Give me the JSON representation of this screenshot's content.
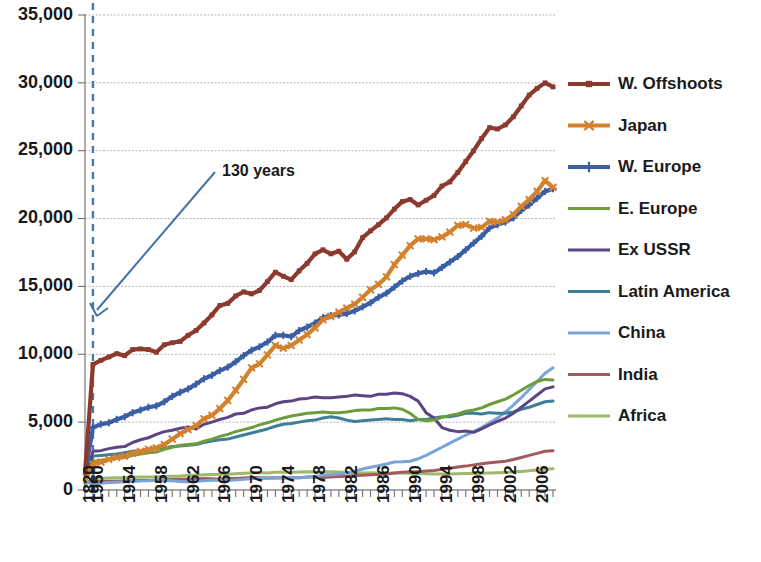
{
  "chart_data": {
    "type": "line",
    "title": "",
    "subtitle": "",
    "xlabel": "",
    "ylabel": "",
    "ylim": [
      0,
      35000
    ],
    "grid": true,
    "legend_position": "right",
    "y_ticks": [
      "0",
      "5,000",
      "10,000",
      "15,000",
      "20,000",
      "25,000",
      "30,000",
      "35,000"
    ],
    "y_tick_values": [
      0,
      5000,
      10000,
      15000,
      20000,
      25000,
      30000,
      35000
    ],
    "x_tick_labels": [
      "1820",
      "1950",
      "1954",
      "1958",
      "1962",
      "1966",
      "1970",
      "1974",
      "1978",
      "1982",
      "1986",
      "1990",
      "1994",
      "1998",
      "2002",
      "2006"
    ],
    "x_tick_values": [
      1820,
      1950,
      1954,
      1958,
      1962,
      1966,
      1970,
      1974,
      1978,
      1982,
      1986,
      1990,
      1994,
      1998,
      2002,
      2006
    ],
    "x_domain_note": "1820 then annual 1950-2008",
    "x": [
      1820,
      1950,
      1951,
      1952,
      1953,
      1954,
      1955,
      1956,
      1957,
      1958,
      1959,
      1960,
      1961,
      1962,
      1963,
      1964,
      1965,
      1966,
      1967,
      1968,
      1969,
      1970,
      1971,
      1972,
      1973,
      1974,
      1975,
      1976,
      1977,
      1978,
      1979,
      1980,
      1981,
      1982,
      1983,
      1984,
      1985,
      1986,
      1987,
      1988,
      1989,
      1990,
      1991,
      1992,
      1993,
      1994,
      1995,
      1996,
      1997,
      1998,
      1999,
      2000,
      2001,
      2002,
      2003,
      2004,
      2005,
      2006,
      2007,
      2008
    ],
    "annotations": [
      {
        "text": "130 years",
        "kind": "arrow-label",
        "points_to_year": 1950,
        "color": "#4472a8"
      }
    ],
    "vertical_marker": {
      "year": 1950,
      "style": "dashed",
      "color": "#4a77b4"
    },
    "series": [
      {
        "name": "W. Offshoots",
        "color": "#8c3a2e",
        "marker": "square",
        "values": [
          1250,
          9250,
          9550,
          9800,
          10050,
          9900,
          10350,
          10400,
          10350,
          10150,
          10700,
          10850,
          10950,
          11400,
          11750,
          12300,
          12900,
          13600,
          13750,
          14300,
          14600,
          14450,
          14700,
          15350,
          16050,
          15750,
          15500,
          16150,
          16700,
          17400,
          17700,
          17400,
          17600,
          17000,
          17550,
          18600,
          19100,
          19550,
          20050,
          20700,
          21250,
          21400,
          21000,
          21350,
          21700,
          22400,
          22700,
          23400,
          24200,
          25000,
          25900,
          26700,
          26600,
          26900,
          27500,
          28300,
          29100,
          29600,
          30000,
          29700
        ],
        "y_start_1820": 1250,
        "y_end_2008": 29700
      },
      {
        "name": "Japan",
        "color": "#d4812e",
        "marker": "x",
        "values": [
          700,
          1900,
          2050,
          2250,
          2400,
          2500,
          2700,
          2850,
          3000,
          3100,
          3350,
          3750,
          4150,
          4450,
          4750,
          5250,
          5500,
          6000,
          6600,
          7350,
          8150,
          9000,
          9300,
          9950,
          10650,
          10450,
          10650,
          11050,
          11450,
          11950,
          12550,
          12800,
          13100,
          13400,
          13700,
          14200,
          14750,
          15150,
          15700,
          16600,
          17300,
          18000,
          18500,
          18500,
          18450,
          18650,
          19000,
          19500,
          19550,
          19300,
          19350,
          19800,
          19750,
          19900,
          20300,
          20900,
          21400,
          22000,
          22800,
          22300
        ],
        "y_start_1820": 700,
        "y_end_2008": 22300
      },
      {
        "name": "W. Europe",
        "color": "#3b5fa5",
        "marker": "plus",
        "values": [
          1200,
          4600,
          4850,
          4950,
          5200,
          5400,
          5700,
          5900,
          6100,
          6200,
          6500,
          6900,
          7200,
          7450,
          7800,
          8200,
          8450,
          8800,
          9050,
          9450,
          9900,
          10300,
          10550,
          10900,
          11400,
          11400,
          11300,
          11750,
          12000,
          12300,
          12700,
          12850,
          12900,
          13000,
          13200,
          13500,
          13800,
          14200,
          14500,
          14950,
          15400,
          15750,
          15950,
          16100,
          16000,
          16400,
          16800,
          17200,
          17700,
          18200,
          18700,
          19300,
          19550,
          19750,
          20050,
          20600,
          21000,
          21500,
          22000,
          22200
        ],
        "y_start_1820": 1200,
        "y_end_2008": 22200
      },
      {
        "name": "E. Europe",
        "color": "#6e9c3c",
        "marker": "none",
        "values": [
          700,
          2100,
          2200,
          2250,
          2350,
          2400,
          2550,
          2650,
          2750,
          2800,
          3000,
          3150,
          3300,
          3350,
          3400,
          3600,
          3750,
          3950,
          4100,
          4300,
          4450,
          4600,
          4800,
          4950,
          5150,
          5300,
          5450,
          5550,
          5650,
          5700,
          5750,
          5700,
          5700,
          5750,
          5850,
          5900,
          5900,
          6000,
          6000,
          6050,
          5950,
          5650,
          5200,
          5100,
          5150,
          5350,
          5500,
          5600,
          5800,
          5900,
          6050,
          6300,
          6500,
          6700,
          7000,
          7350,
          7700,
          8000,
          8150,
          8100
        ],
        "y_start_1820": 700,
        "y_end_2008": 8100
      },
      {
        "name": "Ex USSR",
        "color": "#5b4582",
        "marker": "none",
        "values": [
          700,
          2850,
          2900,
          3050,
          3150,
          3200,
          3500,
          3700,
          3850,
          4100,
          4300,
          4400,
          4550,
          4650,
          4500,
          4850,
          5000,
          5200,
          5350,
          5600,
          5650,
          5900,
          6050,
          6100,
          6350,
          6500,
          6550,
          6700,
          6750,
          6850,
          6800,
          6800,
          6850,
          6900,
          7000,
          6950,
          6900,
          7050,
          7050,
          7150,
          7100,
          6900,
          6550,
          5700,
          5300,
          4600,
          4400,
          4300,
          4350,
          4250,
          4500,
          4800,
          5050,
          5300,
          5650,
          6100,
          6550,
          7000,
          7450,
          7600
        ],
        "y_start_1820": 700,
        "y_end_2008": 7600
      },
      {
        "name": "Latin America",
        "color": "#3d7f96",
        "marker": "none",
        "values": [
          700,
          2500,
          2550,
          2600,
          2650,
          2750,
          2850,
          2900,
          3000,
          3050,
          3100,
          3200,
          3250,
          3300,
          3350,
          3500,
          3600,
          3700,
          3750,
          3900,
          4050,
          4200,
          4350,
          4500,
          4700,
          4850,
          4900,
          5000,
          5100,
          5150,
          5300,
          5400,
          5300,
          5150,
          5050,
          5100,
          5150,
          5200,
          5250,
          5200,
          5200,
          5100,
          5200,
          5200,
          5300,
          5400,
          5400,
          5500,
          5650,
          5650,
          5600,
          5700,
          5650,
          5650,
          5750,
          5950,
          6100,
          6300,
          6500,
          6550
        ],
        "y_start_1820": 700,
        "y_end_2008": 6550
      },
      {
        "name": "China",
        "color": "#7ba3d6",
        "marker": "none",
        "values": [
          600,
          450,
          500,
          550,
          580,
          600,
          620,
          660,
          680,
          720,
          700,
          690,
          620,
          600,
          640,
          690,
          720,
          740,
          720,
          740,
          790,
          840,
          860,
          870,
          920,
          930,
          920,
          900,
          940,
          1000,
          1080,
          1120,
          1160,
          1260,
          1380,
          1550,
          1680,
          1790,
          1920,
          2060,
          2080,
          2120,
          2300,
          2550,
          2850,
          3150,
          3450,
          3750,
          4050,
          4300,
          4600,
          4950,
          5300,
          5750,
          6250,
          6800,
          7400,
          8000,
          8600,
          9000
        ],
        "y_start_1820": 600,
        "y_end_2008": 6700
      },
      {
        "name": "India",
        "color": "#a25b5b",
        "marker": "none",
        "values": [
          530,
          620,
          630,
          640,
          650,
          670,
          690,
          710,
          700,
          740,
          760,
          780,
          790,
          790,
          810,
          850,
          820,
          800,
          840,
          850,
          880,
          920,
          910,
          890,
          900,
          880,
          920,
          910,
          950,
          980,
          920,
          960,
          990,
          1010,
          1060,
          1090,
          1120,
          1150,
          1170,
          1250,
          1310,
          1350,
          1340,
          1400,
          1440,
          1520,
          1600,
          1700,
          1760,
          1850,
          1940,
          2010,
          2070,
          2120,
          2250,
          2400,
          2550,
          2700,
          2850,
          2900
        ],
        "y_start_1820": 530,
        "y_end_2008": 2900
      },
      {
        "name": "Africa",
        "color": "#9cba6a",
        "marker": "none",
        "values": [
          420,
          850,
          870,
          880,
          900,
          910,
          940,
          960,
          960,
          970,
          1000,
          1020,
          1030,
          1060,
          1090,
          1130,
          1140,
          1160,
          1160,
          1200,
          1230,
          1260,
          1270,
          1260,
          1300,
          1310,
          1300,
          1330,
          1340,
          1320,
          1330,
          1340,
          1330,
          1300,
          1270,
          1260,
          1270,
          1250,
          1240,
          1250,
          1250,
          1240,
          1220,
          1190,
          1170,
          1170,
          1180,
          1200,
          1210,
          1220,
          1230,
          1250,
          1270,
          1290,
          1320,
          1370,
          1420,
          1470,
          1520,
          1560
        ],
        "y_start_1820": 420,
        "y_end_2008": 1560
      }
    ]
  },
  "legend": {
    "items": [
      {
        "label": "W. Offshoots"
      },
      {
        "label": "Japan"
      },
      {
        "label": "W. Europe"
      },
      {
        "label": "E. Europe"
      },
      {
        "label": "Ex USSR"
      },
      {
        "label": "Latin America"
      },
      {
        "label": "China"
      },
      {
        "label": "India"
      },
      {
        "label": "Africa"
      }
    ]
  },
  "annotation": {
    "text": "130 years"
  },
  "axes": {
    "y_labels": [
      "35,000",
      "30,000",
      "25,000",
      "20,000",
      "15,000",
      "10,000",
      "5,000",
      "0"
    ],
    "x_labels": [
      "1820",
      "1950",
      "1954",
      "1958",
      "1962",
      "1966",
      "1970",
      "1974",
      "1978",
      "1982",
      "1986",
      "1990",
      "1994",
      "1998",
      "2002",
      "2006"
    ]
  }
}
